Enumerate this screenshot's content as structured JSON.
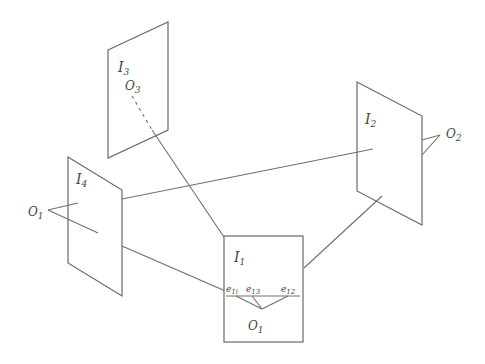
{
  "diagram": {
    "type": "multi-camera epipolar geometry",
    "planes": [
      {
        "id": "I1",
        "label": "I",
        "subscript": "1"
      },
      {
        "id": "I2",
        "label": "I",
        "subscript": "2"
      },
      {
        "id": "I3",
        "label": "I",
        "subscript": "3"
      },
      {
        "id": "I4",
        "label": "I",
        "subscript": "4"
      }
    ],
    "centers": [
      {
        "id": "O1",
        "label": "O",
        "subscript": "1"
      },
      {
        "id": "O2",
        "label": "O",
        "subscript": "2"
      },
      {
        "id": "O3",
        "label": "O",
        "subscript": "3"
      },
      {
        "id": "O4",
        "label": "O",
        "subscript": "1"
      }
    ],
    "epipoles": [
      {
        "id": "e14",
        "label": "e",
        "subscript": "1i"
      },
      {
        "id": "e13",
        "label": "e",
        "subscript": "13"
      },
      {
        "id": "e12",
        "label": "e",
        "subscript": "12"
      }
    ],
    "colors": {
      "line": "#6f6f6f",
      "text": "#444444",
      "background": "#ffffff"
    }
  }
}
